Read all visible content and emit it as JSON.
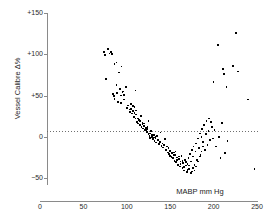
{
  "chart_data": {
    "type": "scatter",
    "title": "",
    "xlabel": "MABP mm Hg",
    "ylabel": "Vessel Calibre Δ%",
    "xlim": [
      0,
      250
    ],
    "ylim": [
      -50,
      150
    ],
    "xticks": [
      0,
      50,
      100,
      150,
      200,
      250
    ],
    "xtick_labels": [
      "0",
      "50",
      "100",
      "150",
      "200",
      "250"
    ],
    "yticks": [
      -50,
      0,
      50,
      100,
      150
    ],
    "ytick_labels": [
      "−50",
      "0",
      "+50",
      "+100",
      "+150"
    ],
    "grid": false,
    "legend": null,
    "annotations": [
      {
        "type": "hline",
        "y": 0,
        "style": "dotted",
        "label": "zero reference line"
      }
    ],
    "marker": {
      "shape": "square",
      "color": "#000000",
      "size": 2
    },
    "series": [
      {
        "name": "Vessel calibre response",
        "points": [
          [
            74,
            103
          ],
          [
            75,
            99
          ],
          [
            76,
            70
          ],
          [
            78,
            106
          ],
          [
            80,
            101
          ],
          [
            82,
            103
          ],
          [
            83,
            100
          ],
          [
            84,
            52
          ],
          [
            85,
            49
          ],
          [
            86,
            88
          ],
          [
            88,
            90
          ],
          [
            88,
            63
          ],
          [
            90,
            42
          ],
          [
            91,
            78
          ],
          [
            92,
            58
          ],
          [
            93,
            50
          ],
          [
            94,
            85
          ],
          [
            95,
            54
          ],
          [
            96,
            55
          ],
          [
            97,
            45
          ],
          [
            99,
            60
          ],
          [
            100,
            35
          ],
          [
            101,
            38
          ],
          [
            103,
            33
          ],
          [
            104,
            30
          ],
          [
            105,
            34
          ],
          [
            106,
            28
          ],
          [
            107,
            31
          ],
          [
            108,
            24
          ],
          [
            109,
            36
          ],
          [
            110,
            22
          ],
          [
            110,
            56
          ],
          [
            111,
            27
          ],
          [
            112,
            18
          ],
          [
            113,
            16
          ],
          [
            114,
            20
          ],
          [
            115,
            14
          ],
          [
            116,
            25
          ],
          [
            117,
            12
          ],
          [
            118,
            17
          ],
          [
            119,
            10
          ],
          [
            120,
            13
          ],
          [
            121,
            8
          ],
          [
            122,
            11
          ],
          [
            123,
            6
          ],
          [
            124,
            9
          ],
          [
            125,
            3
          ],
          [
            125,
            19
          ],
          [
            126,
            1
          ],
          [
            127,
            4
          ],
          [
            128,
            -1
          ],
          [
            128,
            7
          ],
          [
            129,
            0
          ],
          [
            130,
            -3
          ],
          [
            131,
            2
          ],
          [
            132,
            -5
          ],
          [
            133,
            -2
          ],
          [
            134,
            -7
          ],
          [
            135,
            1
          ],
          [
            136,
            -4
          ],
          [
            137,
            -9
          ],
          [
            138,
            -6
          ],
          [
            139,
            5
          ],
          [
            140,
            -11
          ],
          [
            141,
            -8
          ],
          [
            142,
            -13
          ],
          [
            143,
            -10
          ],
          [
            144,
            -3
          ],
          [
            145,
            -16
          ],
          [
            146,
            -12
          ],
          [
            147,
            -19
          ],
          [
            148,
            -14
          ],
          [
            149,
            -21
          ],
          [
            150,
            -17
          ],
          [
            151,
            -24
          ],
          [
            152,
            -20
          ],
          [
            153,
            -26
          ],
          [
            154,
            -22
          ],
          [
            155,
            -29
          ],
          [
            156,
            -18
          ],
          [
            157,
            -31
          ],
          [
            158,
            -25
          ],
          [
            159,
            -34
          ],
          [
            160,
            -27
          ],
          [
            161,
            -36
          ],
          [
            162,
            -30
          ],
          [
            163,
            -23
          ],
          [
            164,
            -38
          ],
          [
            165,
            -32
          ],
          [
            166,
            -41
          ],
          [
            167,
            -28
          ],
          [
            168,
            -35
          ],
          [
            169,
            -43
          ],
          [
            170,
            -33
          ],
          [
            171,
            -26
          ],
          [
            172,
            -39
          ],
          [
            173,
            -21
          ],
          [
            174,
            -30
          ],
          [
            175,
            -16
          ],
          [
            175,
            -42
          ],
          [
            176,
            -24
          ],
          [
            177,
            -12
          ],
          [
            178,
            -34
          ],
          [
            179,
            -18
          ],
          [
            180,
            -8
          ],
          [
            181,
            -28
          ],
          [
            182,
            -2
          ],
          [
            183,
            -14
          ],
          [
            184,
            4
          ],
          [
            185,
            -22
          ],
          [
            186,
            0
          ],
          [
            187,
            9
          ],
          [
            188,
            -6
          ],
          [
            189,
            14
          ],
          [
            190,
            -16
          ],
          [
            191,
            3
          ],
          [
            192,
            19
          ],
          [
            193,
            -10
          ],
          [
            194,
            7
          ],
          [
            195,
            22
          ],
          [
            196,
            -4
          ],
          [
            197,
            18
          ],
          [
            198,
            12
          ],
          [
            199,
            -2
          ],
          [
            200,
            66
          ],
          [
            201,
            8
          ],
          [
            203,
            -12
          ],
          [
            205,
            111
          ],
          [
            206,
            0
          ],
          [
            208,
            -26
          ],
          [
            210,
            17
          ],
          [
            211,
            82
          ],
          [
            212,
            76
          ],
          [
            213,
            -20
          ],
          [
            215,
            60
          ],
          [
            216,
            -5
          ],
          [
            222,
            86
          ],
          [
            226,
            126
          ],
          [
            228,
            79
          ],
          [
            240,
            45
          ],
          [
            247,
            -39
          ],
          [
            126,
            0
          ],
          [
            127,
            -2
          ],
          [
            129,
            2
          ],
          [
            131,
            -1
          ],
          [
            133,
            0
          ],
          [
            148,
            -20
          ],
          [
            150,
            -23
          ],
          [
            152,
            -25
          ],
          [
            154,
            -19
          ],
          [
            156,
            -22
          ],
          [
            158,
            -28
          ],
          [
            160,
            -24
          ],
          [
            162,
            -33
          ],
          [
            164,
            -29
          ],
          [
            166,
            -37
          ],
          [
            168,
            -31
          ],
          [
            170,
            -40
          ],
          [
            172,
            -35
          ],
          [
            174,
            -44
          ],
          [
            176,
            -38
          ],
          [
            178,
            -41
          ],
          [
            180,
            -36
          ],
          [
            182,
            -30
          ],
          [
            184,
            -24
          ],
          [
            186,
            -18
          ],
          [
            188,
            -12
          ],
          [
            113,
            22
          ],
          [
            115,
            19
          ],
          [
            118,
            15
          ],
          [
            120,
            16
          ],
          [
            122,
            8
          ],
          [
            124,
            12
          ],
          [
            105,
            40
          ],
          [
            107,
            37
          ],
          [
            109,
            29
          ],
          [
            111,
            32
          ],
          [
            86,
            46
          ],
          [
            89,
            53
          ],
          [
            93,
            41
          ],
          [
            97,
            51
          ]
        ]
      }
    ]
  },
  "axes": {
    "y_label": "Vessel Calibre Δ%",
    "x_label": "MABP mm Hg",
    "y_ticks": [
      {
        "value": 150,
        "label": "+150"
      },
      {
        "value": 100,
        "label": "+100"
      },
      {
        "value": 50,
        "label": "+50"
      },
      {
        "value": 0,
        "label": "0"
      },
      {
        "value": -50,
        "label": "−50"
      }
    ],
    "x_ticks": [
      {
        "value": 0,
        "label": "0"
      },
      {
        "value": 50,
        "label": "50"
      },
      {
        "value": 100,
        "label": "100"
      },
      {
        "value": 150,
        "label": "150"
      },
      {
        "value": 200,
        "label": "200"
      },
      {
        "value": 250,
        "label": "250"
      }
    ]
  },
  "colors": {
    "marker": "#000000",
    "axis": "#8a8a8a",
    "text": "#1d1d1d",
    "zero_line": "#6f6f6f",
    "background": "#ffffff"
  }
}
